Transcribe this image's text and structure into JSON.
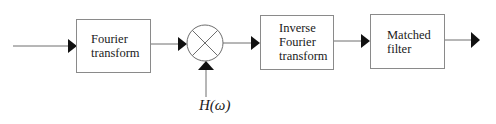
{
  "diagram": {
    "type": "signal-processing-block-diagram",
    "blocks": [
      {
        "id": "fourier",
        "lines": [
          "Fourier",
          "transform"
        ]
      },
      {
        "id": "multiplier",
        "symbol": "⊗"
      },
      {
        "id": "inverse_fourier",
        "lines": [
          "Inverse",
          "Fourier",
          "transform"
        ]
      },
      {
        "id": "matched_filter",
        "lines": [
          "Matched",
          "filter"
        ]
      }
    ],
    "multiplier_input_label": "H(ω)",
    "colors": {
      "stroke": "#6e6e6e",
      "arrow": "#111111",
      "text": "#1a1a1a"
    }
  }
}
